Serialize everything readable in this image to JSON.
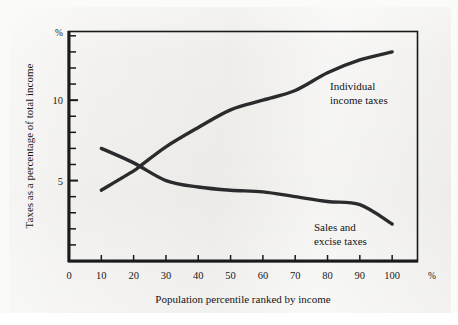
{
  "chart_data": {
    "type": "line",
    "title": "",
    "xlabel": "Population percentile ranked by income",
    "ylabel": "Taxes as a percentage of total income",
    "x_unit_label": "%",
    "y_unit_label": "%",
    "xlim": [
      0,
      108
    ],
    "ylim": [
      0,
      14.3
    ],
    "x_ticks": [
      0,
      10,
      20,
      30,
      40,
      50,
      60,
      70,
      80,
      90,
      100
    ],
    "x_tick_labels": [
      "0",
      "10",
      "20",
      "30",
      "40",
      "50",
      "60",
      "70",
      "80",
      "90",
      "100"
    ],
    "y_ticks_major": [
      5,
      10
    ],
    "y_tick_labels_major": [
      "5",
      "10"
    ],
    "y_ticks_minor": [
      1,
      2,
      3,
      4,
      6,
      7,
      8,
      9,
      11,
      12,
      13,
      14
    ],
    "grid": false,
    "legend_position": "inline-annotation",
    "line_color": "#2b2b2e",
    "frame_color": "#1a1a1c",
    "background_color": "#f2f1ee",
    "series": [
      {
        "name": "Individual income taxes",
        "annotation_lines": [
          "Individual",
          "income taxes"
        ],
        "x": [
          10,
          20,
          22,
          30,
          40,
          50,
          60,
          70,
          80,
          90,
          100
        ],
        "values": [
          4.4,
          5.6,
          5.9,
          7.1,
          8.3,
          9.4,
          10.0,
          10.6,
          11.7,
          12.5,
          13.0
        ]
      },
      {
        "name": "Sales and excise taxes",
        "annotation_lines": [
          "Sales and",
          "excise taxes"
        ],
        "x": [
          10,
          20,
          30,
          40,
          50,
          60,
          70,
          80,
          90,
          100
        ],
        "values": [
          7.0,
          6.1,
          5.0,
          4.6,
          4.4,
          4.3,
          4.0,
          3.7,
          3.5,
          2.3
        ]
      }
    ]
  },
  "figure": {
    "y_axis_title": "Taxes as a percentage of total income",
    "x_axis_title": "Population percentile ranked by income",
    "y_axis_unit": "%",
    "x_axis_unit": "%",
    "x_tick_labels": [
      "0",
      "10",
      "20",
      "30",
      "40",
      "50",
      "60",
      "70",
      "80",
      "90",
      "100"
    ],
    "y_tick_labels": [
      "5",
      "10"
    ],
    "annotation_income_line1": "Individual",
    "annotation_income_line2": "income taxes",
    "annotation_sales_line1": "Sales and",
    "annotation_sales_line2": "excise taxes"
  }
}
